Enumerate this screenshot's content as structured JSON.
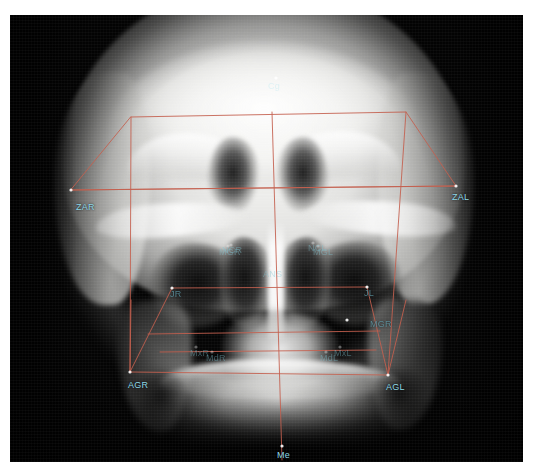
{
  "image": {
    "modality": "Posteroanterior cephalometric radiograph",
    "frame": {
      "x": 10,
      "y": 15,
      "width": 513,
      "height": 447
    },
    "background_color": "#ffffff",
    "film_color": "#050505"
  },
  "overlay": {
    "tracing_color": "#c4604f",
    "landmark_point_color": "#ffffff",
    "label_color": "#8fd8e6",
    "line_width": 1
  },
  "landmarks": [
    {
      "id": "Cg",
      "label": "Cg",
      "x": 276,
      "y": 78,
      "lx": 268,
      "ly": 82,
      "style": "onfilm"
    },
    {
      "id": "ZAR",
      "label": "ZAR",
      "x": 71,
      "y": 190,
      "lx": 76,
      "ly": 203,
      "style": "bright"
    },
    {
      "id": "ZAL",
      "label": "ZAL",
      "x": 456,
      "y": 186,
      "lx": 452,
      "ly": 193,
      "style": "bright"
    },
    {
      "id": "NCR",
      "label": "NCR",
      "x": 231,
      "y": 245,
      "lx": 222,
      "ly": 246,
      "style": "faint"
    },
    {
      "id": "NCL",
      "label": "NCL",
      "x": 313,
      "y": 243,
      "lx": 308,
      "ly": 244,
      "style": "faint"
    },
    {
      "id": "ANS",
      "label": "ANS",
      "x": 271,
      "y": 268,
      "lx": 263,
      "ly": 270,
      "style": "faint"
    },
    {
      "id": "MGR",
      "label": "MGR",
      "x": 228,
      "y": 246,
      "lx": 219,
      "ly": 248,
      "style": "faint"
    },
    {
      "id": "MGL",
      "label": "MGL",
      "x": 318,
      "y": 246,
      "lx": 313,
      "ly": 248,
      "style": "faint"
    },
    {
      "id": "JR",
      "label": "JR",
      "x": 172,
      "y": 288,
      "lx": 170,
      "ly": 290,
      "style": "dim"
    },
    {
      "id": "JL",
      "label": "JL",
      "x": 367,
      "y": 287,
      "lx": 364,
      "ly": 289,
      "style": "dim"
    },
    {
      "id": "AGR",
      "label": "AGR",
      "x": 130,
      "y": 372,
      "lx": 128,
      "ly": 381,
      "style": "bright"
    },
    {
      "id": "AGL",
      "label": "AGL",
      "x": 388,
      "y": 375,
      "lx": 386,
      "ly": 383,
      "style": "bright"
    },
    {
      "id": "MxR",
      "label": "MxR",
      "x": 196,
      "y": 347,
      "lx": 190,
      "ly": 349,
      "style": "faint"
    },
    {
      "id": "MxL",
      "label": "MxL",
      "x": 340,
      "y": 347,
      "lx": 334,
      "ly": 349,
      "style": "faint"
    },
    {
      "id": "MdR",
      "label": "MdR",
      "x": 212,
      "y": 352,
      "lx": 206,
      "ly": 354,
      "style": "faint"
    },
    {
      "id": "MdL",
      "label": "MdL",
      "x": 326,
      "y": 352,
      "lx": 320,
      "ly": 354,
      "style": "faint"
    },
    {
      "id": "MGR2",
      "label": "MGR",
      "x": 347,
      "y": 320,
      "lx": 370,
      "ly": 320,
      "style": "dim"
    },
    {
      "id": "Me",
      "label": "Me",
      "x": 282,
      "y": 446,
      "lx": 277,
      "ly": 451,
      "style": "bright"
    }
  ],
  "tracing": {
    "upper_frame": [
      {
        "x": 131,
        "y": 117
      },
      {
        "x": 406,
        "y": 112
      },
      {
        "x": 456,
        "y": 186
      },
      {
        "x": 71,
        "y": 190
      }
    ],
    "lower_frame": [
      {
        "x": 130,
        "y": 372
      },
      {
        "x": 388,
        "y": 375
      }
    ],
    "left_rail": [
      {
        "x": 131,
        "y": 117
      },
      {
        "x": 130,
        "y": 372
      }
    ],
    "right_rail": [
      {
        "x": 406,
        "y": 112
      },
      {
        "x": 388,
        "y": 375
      }
    ],
    "midline": [
      {
        "x": 272,
        "y": 112
      },
      {
        "x": 282,
        "y": 460
      }
    ],
    "zygomatic_line": [
      {
        "x": 71,
        "y": 190
      },
      {
        "x": 456,
        "y": 186
      }
    ],
    "jugal_line": [
      {
        "x": 172,
        "y": 288
      },
      {
        "x": 367,
        "y": 287
      }
    ],
    "occlusal_line": [
      {
        "x": 148,
        "y": 334
      },
      {
        "x": 380,
        "y": 331
      }
    ],
    "maxillary_line": [
      {
        "x": 160,
        "y": 352
      },
      {
        "x": 376,
        "y": 350
      }
    ],
    "antegonial_line": [
      {
        "x": 130,
        "y": 372
      },
      {
        "x": 388,
        "y": 375
      }
    ],
    "ramus_right": [
      {
        "x": 172,
        "y": 288
      },
      {
        "x": 130,
        "y": 372
      }
    ],
    "ramus_left": [
      {
        "x": 367,
        "y": 287
      },
      {
        "x": 388,
        "y": 375
      }
    ],
    "gonial_right": [
      {
        "x": 131,
        "y": 300
      },
      {
        "x": 130,
        "y": 372
      }
    ],
    "gonial_left": [
      {
        "x": 406,
        "y": 300
      },
      {
        "x": 388,
        "y": 375
      }
    ]
  }
}
